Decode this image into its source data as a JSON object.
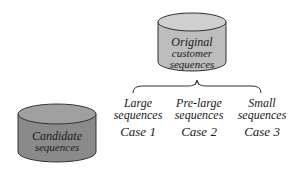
{
  "nodes": {
    "original": {
      "label_line1": "Original",
      "label_line2": "customer",
      "label_line3": "sequences",
      "fill": "#bdbdbd"
    },
    "candidate": {
      "label_line1": "Candidate",
      "label_line2": "sequences",
      "fill": "#8a8a8a"
    }
  },
  "branches": [
    {
      "line1": "Large",
      "line2": "sequences",
      "case": "Case 1"
    },
    {
      "line1": "Pre-large",
      "line2": "sequences",
      "case": "Case 2"
    },
    {
      "line1": "Small",
      "line2": "sequences",
      "case": "Case 3"
    }
  ]
}
